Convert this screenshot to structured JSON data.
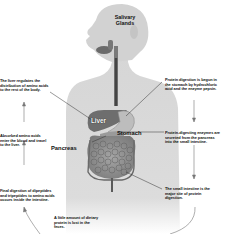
{
  "diagram": {
    "organ_labels": {
      "salivary_glands": [
        "Salivary",
        "Glands"
      ],
      "liver": "Liver",
      "stomach": "Stomach",
      "pancreas": "Pancreas"
    },
    "notes": {
      "liver_regulates": [
        "The liver regulates the",
        "distribution of amino acids",
        "to the rest of the body."
      ],
      "absorbed_amino": [
        "Absorbed amino acids",
        "enter the blood and travel",
        "to the liver."
      ],
      "final_digestion": [
        "Final digestion of dipeptides",
        "and tripeptides to amino acids",
        "occurs inside the intestine."
      ],
      "feces": [
        "A little amount of dietary",
        "protein is lost in the",
        "feces."
      ],
      "stomach_digestion": [
        "Protein digestion is begun in",
        "the stomach by hydrochloric",
        "acid and the enzyme pepsin."
      ],
      "pancreas_enzymes": [
        "Protein-digesting enzymes are",
        "secreted from the pancreas",
        "into the small intestine."
      ],
      "small_intestine": [
        "The small intestine is the",
        "major site of protein",
        "digestion."
      ]
    },
    "colors": {
      "body_fill": "#d9d9d9",
      "body_shadow": "#bfbfbf",
      "organ_dark": "#6e6e6e",
      "organ_mid": "#8f8f8f",
      "intestine": "#9a9a9a",
      "line": "#333333",
      "text": "#111111"
    }
  }
}
